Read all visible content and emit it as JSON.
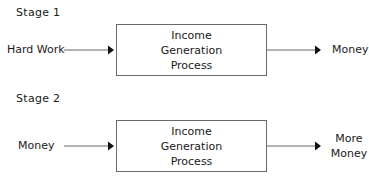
{
  "stages": [
    {
      "title": "Stage 1",
      "input": "Hard Work",
      "process": "Income Generation Process",
      "output": "Money"
    },
    {
      "title": "Stage 2",
      "input": "Money",
      "process": "Income Generation Process",
      "output_line1": "More",
      "output_line2": "Money"
    }
  ],
  "colors": {
    "box_border": "#6a6a6a",
    "arrow": "#555555",
    "text": "#1a1a1a"
  }
}
